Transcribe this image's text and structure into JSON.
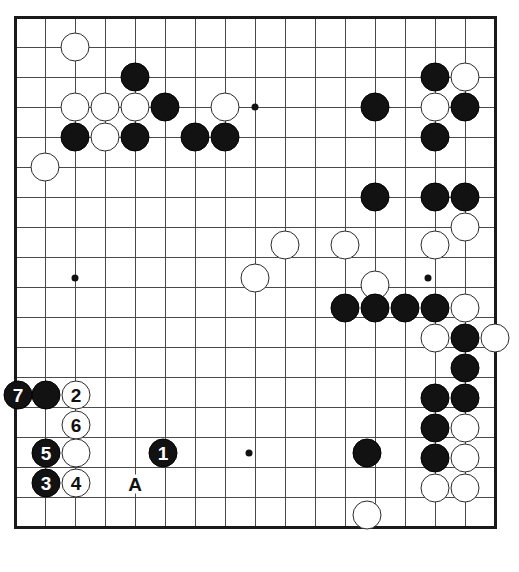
{
  "diagram": {
    "kind": "go-board-problem-diagram",
    "board": {
      "width_px": 519,
      "height_px": 572,
      "columns": 17,
      "rows": 18,
      "cell_px": 30,
      "origin_x": 15,
      "origin_y": 17,
      "line_color": "#4a4a4a",
      "border_color": "#1a1a1a",
      "background": "#ffffff",
      "edges": {
        "top": true,
        "left": true,
        "right": true,
        "bottom": true
      },
      "star_points": [
        {
          "x": 75,
          "y": 107
        },
        {
          "x": 255,
          "y": 107
        },
        {
          "x": 435,
          "y": 107
        },
        {
          "x": 75,
          "y": 278
        },
        {
          "x": 255,
          "y": 278
        },
        {
          "x": 428,
          "y": 278
        },
        {
          "x": 249,
          "y": 453
        }
      ]
    },
    "stones": [
      {
        "color": "white",
        "x": 75,
        "y": 47,
        "label": ""
      },
      {
        "color": "black",
        "x": 135,
        "y": 77,
        "label": ""
      },
      {
        "color": "white",
        "x": 75,
        "y": 107,
        "label": ""
      },
      {
        "color": "white",
        "x": 105,
        "y": 107,
        "label": ""
      },
      {
        "color": "white",
        "x": 135,
        "y": 107,
        "label": ""
      },
      {
        "color": "black",
        "x": 165,
        "y": 107,
        "label": ""
      },
      {
        "color": "white",
        "x": 225,
        "y": 107,
        "label": ""
      },
      {
        "color": "black",
        "x": 75,
        "y": 137,
        "label": ""
      },
      {
        "color": "white",
        "x": 105,
        "y": 137,
        "label": ""
      },
      {
        "color": "black",
        "x": 135,
        "y": 137,
        "label": ""
      },
      {
        "color": "black",
        "x": 195,
        "y": 137,
        "label": ""
      },
      {
        "color": "black",
        "x": 225,
        "y": 137,
        "label": ""
      },
      {
        "color": "white",
        "x": 45,
        "y": 167,
        "label": ""
      },
      {
        "color": "black",
        "x": 375,
        "y": 107,
        "label": ""
      },
      {
        "color": "black",
        "x": 435,
        "y": 77,
        "label": ""
      },
      {
        "color": "white",
        "x": 465,
        "y": 77,
        "label": ""
      },
      {
        "color": "white",
        "x": 435,
        "y": 107,
        "label": ""
      },
      {
        "color": "black",
        "x": 465,
        "y": 107,
        "label": ""
      },
      {
        "color": "black",
        "x": 435,
        "y": 137,
        "label": ""
      },
      {
        "color": "black",
        "x": 375,
        "y": 197,
        "label": ""
      },
      {
        "color": "black",
        "x": 435,
        "y": 197,
        "label": ""
      },
      {
        "color": "black",
        "x": 465,
        "y": 197,
        "label": ""
      },
      {
        "color": "white",
        "x": 465,
        "y": 227,
        "label": ""
      },
      {
        "color": "white",
        "x": 285,
        "y": 245,
        "label": ""
      },
      {
        "color": "white",
        "x": 345,
        "y": 245,
        "label": ""
      },
      {
        "color": "white",
        "x": 435,
        "y": 245,
        "label": ""
      },
      {
        "color": "white",
        "x": 255,
        "y": 278,
        "label": ""
      },
      {
        "color": "white",
        "x": 375,
        "y": 285,
        "label": ""
      },
      {
        "color": "black",
        "x": 345,
        "y": 308,
        "label": ""
      },
      {
        "color": "black",
        "x": 375,
        "y": 308,
        "label": ""
      },
      {
        "color": "black",
        "x": 405,
        "y": 308,
        "label": ""
      },
      {
        "color": "black",
        "x": 435,
        "y": 308,
        "label": ""
      },
      {
        "color": "white",
        "x": 465,
        "y": 308,
        "label": ""
      },
      {
        "color": "white",
        "x": 435,
        "y": 338,
        "label": ""
      },
      {
        "color": "black",
        "x": 465,
        "y": 338,
        "label": ""
      },
      {
        "color": "white",
        "x": 495,
        "y": 338,
        "label": ""
      },
      {
        "color": "black",
        "x": 465,
        "y": 368,
        "label": ""
      },
      {
        "color": "black",
        "x": 435,
        "y": 398,
        "label": ""
      },
      {
        "color": "black",
        "x": 465,
        "y": 398,
        "label": ""
      },
      {
        "color": "black",
        "x": 435,
        "y": 428,
        "label": ""
      },
      {
        "color": "white",
        "x": 465,
        "y": 428,
        "label": ""
      },
      {
        "color": "black",
        "x": 435,
        "y": 458,
        "label": ""
      },
      {
        "color": "white",
        "x": 465,
        "y": 458,
        "label": ""
      },
      {
        "color": "black",
        "x": 367,
        "y": 453,
        "label": ""
      },
      {
        "color": "white",
        "x": 435,
        "y": 488,
        "label": ""
      },
      {
        "color": "white",
        "x": 465,
        "y": 488,
        "label": ""
      },
      {
        "color": "white",
        "x": 367,
        "y": 515,
        "label": ""
      },
      {
        "color": "black",
        "x": 18,
        "y": 395,
        "label": "7"
      },
      {
        "color": "black",
        "x": 46,
        "y": 395,
        "label": ""
      },
      {
        "color": "white",
        "x": 76,
        "y": 395,
        "label": "2"
      },
      {
        "color": "white",
        "x": 76,
        "y": 425,
        "label": "6"
      },
      {
        "color": "black",
        "x": 46,
        "y": 453,
        "label": "5"
      },
      {
        "color": "white",
        "x": 76,
        "y": 453,
        "label": ""
      },
      {
        "color": "black",
        "x": 163,
        "y": 453,
        "label": "1"
      },
      {
        "color": "black",
        "x": 46,
        "y": 483,
        "label": "3"
      },
      {
        "color": "white",
        "x": 76,
        "y": 483,
        "label": "4"
      }
    ],
    "point_labels": [
      {
        "text": "A",
        "x": 135,
        "y": 484
      }
    ]
  }
}
